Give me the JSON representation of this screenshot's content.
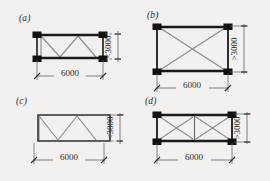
{
  "figure": {
    "background_color": "#f2f1ef",
    "member_color": "#1a1a1a",
    "brace_color": "#8a8a8a",
    "frame_color": "#3b3b3b",
    "dimension_color": "#2d2d2d",
    "span_dimension_value": "6000",
    "panels": [
      {
        "id": "a",
        "label": "(a)",
        "span_label": "6000",
        "height_label": "<3000",
        "height_relation": "less-than",
        "bracing_type": "w-truss",
        "diagonal_count": 4,
        "has_corner_blocks": true,
        "has_center_post": false,
        "frame_style": "heavy-members"
      },
      {
        "id": "b",
        "label": "(b)",
        "span_label": "6000",
        "height_label": ">3000",
        "height_relation": "greater-than",
        "bracing_type": "single-x-brace",
        "diagonal_count": 2,
        "has_corner_blocks": true,
        "has_center_post": false,
        "frame_style": "heavy-members"
      },
      {
        "id": "c",
        "label": "(c)",
        "span_label": "6000",
        "height_label": "<3000",
        "height_relation": "less-than",
        "bracing_type": "w-truss",
        "diagonal_count": 4,
        "has_corner_blocks": false,
        "has_center_post": false,
        "frame_style": "thin-outline"
      },
      {
        "id": "d",
        "label": "(d)",
        "span_label": "6000",
        "height_label": ">3000",
        "height_relation": "greater-than",
        "bracing_type": "double-x-brace",
        "diagonal_count": 4,
        "has_corner_blocks": true,
        "has_center_post": true,
        "frame_style": "heavy-members"
      }
    ]
  }
}
